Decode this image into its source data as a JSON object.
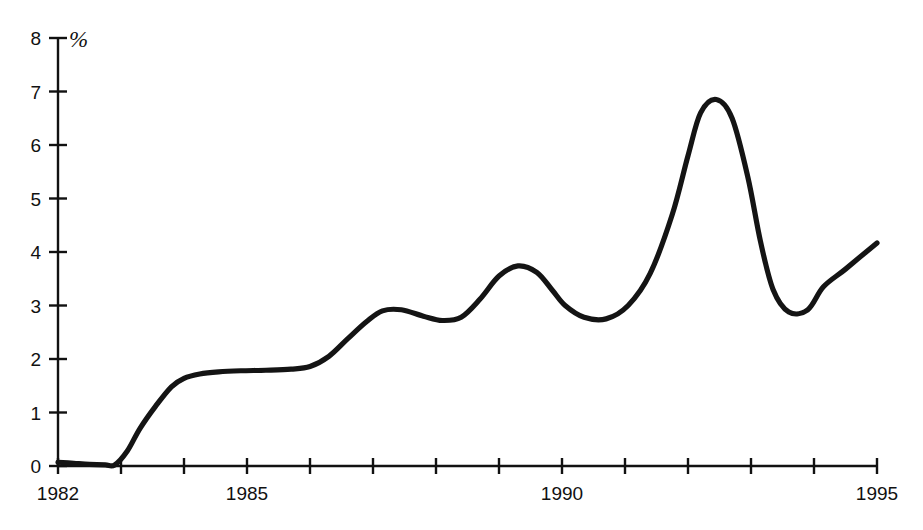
{
  "chart_data": {
    "type": "line",
    "title": "",
    "subtitle": "",
    "xlabel": "",
    "ylabel": "",
    "unit_label": "%",
    "xlim": [
      1982,
      1995
    ],
    "ylim": [
      0,
      8
    ],
    "grid": false,
    "legend": null,
    "x_tick_values": [
      1982,
      1983,
      1984,
      1985,
      1986,
      1987,
      1988,
      1989,
      1990,
      1991,
      1992,
      1993,
      1994,
      1995
    ],
    "x_tick_labels": [
      "1982",
      "",
      "",
      "1985",
      "",
      "",
      "",
      "",
      "1990",
      "",
      "",
      "",
      "",
      "1995"
    ],
    "y_tick_values": [
      0,
      1,
      2,
      3,
      4,
      5,
      6,
      7,
      8
    ],
    "y_tick_labels": [
      "0",
      "1",
      "2",
      "3",
      "4",
      "5",
      "6",
      "7",
      "8"
    ],
    "series": [
      {
        "name": "percent",
        "color": "#141414",
        "x": [
          1982.0,
          1982.25,
          1982.5,
          1982.75,
          1982.9,
          1983.1,
          1983.3,
          1983.55,
          1983.8,
          1984.0,
          1984.25,
          1984.55,
          1984.9,
          1985.3,
          1985.7,
          1986.0,
          1986.3,
          1986.6,
          1986.9,
          1987.15,
          1987.45,
          1987.8,
          1988.1,
          1988.4,
          1988.7,
          1989.0,
          1989.3,
          1989.6,
          1989.85,
          1990.05,
          1990.35,
          1990.7,
          1991.05,
          1991.4,
          1991.75,
          1992.0,
          1992.2,
          1992.45,
          1992.7,
          1992.95,
          1993.15,
          1993.35,
          1993.6,
          1993.9,
          1994.15,
          1994.5,
          1995.0
        ],
        "y": [
          0.07,
          0.05,
          0.03,
          0.02,
          0.02,
          0.28,
          0.7,
          1.12,
          1.48,
          1.64,
          1.72,
          1.76,
          1.78,
          1.79,
          1.81,
          1.86,
          2.05,
          2.38,
          2.7,
          2.9,
          2.92,
          2.8,
          2.72,
          2.78,
          3.12,
          3.55,
          3.74,
          3.62,
          3.28,
          3.0,
          2.78,
          2.75,
          3.0,
          3.6,
          4.7,
          5.8,
          6.6,
          6.85,
          6.5,
          5.4,
          4.2,
          3.3,
          2.88,
          2.92,
          3.35,
          3.68,
          4.17
        ]
      }
    ],
    "annotations": []
  },
  "axes": {
    "y_axis_name": "y-axis",
    "x_axis_name": "x-axis"
  }
}
